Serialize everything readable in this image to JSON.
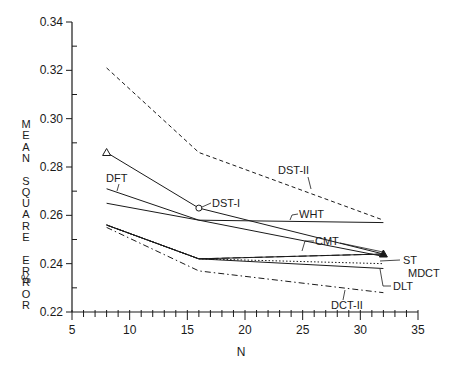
{
  "chart_data": {
    "type": "line",
    "title": "",
    "xlabel": "N",
    "ylabel": "MEAN SQUARE ERROR %",
    "xlim": [
      5,
      35
    ],
    "ylim": [
      0.22,
      0.34
    ],
    "x_ticks": [
      5,
      10,
      15,
      20,
      25,
      30,
      35
    ],
    "y_ticks": [
      0.22,
      0.24,
      0.26,
      0.28,
      0.3,
      0.32,
      0.34
    ],
    "grid": false,
    "x": [
      8,
      16,
      32
    ],
    "series": [
      {
        "name": "DST-II",
        "values": [
          0.321,
          0.286,
          0.258
        ],
        "style": "dashed"
      },
      {
        "name": "DST-I",
        "values": [
          0.286,
          0.263,
          0.244
        ],
        "style": "solid"
      },
      {
        "name": "DFT",
        "values": [
          0.271,
          0.258,
          0.243
        ],
        "style": "solid"
      },
      {
        "name": "WHT",
        "values": [
          0.265,
          0.258,
          0.257
        ],
        "style": "solid"
      },
      {
        "name": "CMT",
        "values": [
          0.256,
          0.242,
          0.244
        ],
        "style": "long-dash"
      },
      {
        "name": "ST",
        "values": [
          0.256,
          0.242,
          0.244
        ],
        "style": "solid"
      },
      {
        "name": "MDCT",
        "values": [
          0.256,
          0.242,
          0.24
        ],
        "style": "dotted"
      },
      {
        "name": "DLT",
        "values": [
          0.256,
          0.242,
          0.238
        ],
        "style": "solid"
      },
      {
        "name": "DCT-II",
        "values": [
          0.255,
          0.237,
          0.228
        ],
        "style": "dash-dot"
      }
    ],
    "annotations": [
      "DST-II",
      "DST-I",
      "DFT",
      "WHT",
      "CMT",
      "ST",
      "MDCT",
      "DLT",
      "DCT-II"
    ]
  },
  "axes": {
    "x_label": "N",
    "y_label_chars": [
      "M",
      "E",
      "A",
      "N",
      "",
      "S",
      "Q",
      "U",
      "A",
      "R",
      "E",
      "",
      "E",
      "R",
      "R",
      "O",
      "R"
    ],
    "y_unit": "%",
    "x_tick_labels": [
      "5",
      "10",
      "15",
      "20",
      "25",
      "30",
      "35"
    ],
    "y_tick_labels": [
      "0.22",
      "0.24",
      "0.26",
      "0.28",
      "0.30",
      "0.32",
      "0.34"
    ]
  },
  "labels": {
    "dst2": "DST-II",
    "dst1": "DST-I",
    "dft": "DFT",
    "wht": "WHT",
    "cmt": "CMT",
    "st": "ST",
    "mdct": "MDCT",
    "dlt": "DLT",
    "dct2": "DCT-II"
  }
}
